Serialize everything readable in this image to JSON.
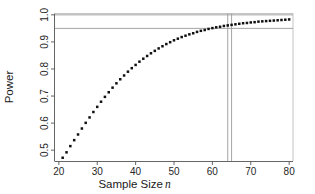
{
  "chart_data": {
    "type": "scatter",
    "title": "",
    "xlabel": "Sample Size",
    "xlabel_italic_suffix": "n",
    "ylabel": "Power",
    "xlim": [
      19,
      81
    ],
    "ylim": [
      0.46,
      1.005
    ],
    "xticks": [
      20,
      30,
      40,
      50,
      60,
      70,
      80
    ],
    "xticklabels": [
      "20",
      "30",
      "40",
      "50",
      "60",
      "70",
      "80"
    ],
    "yticks": [
      0.5,
      0.6,
      0.7,
      0.8,
      0.9,
      1.0
    ],
    "yticklabels": [
      "0.5",
      "0.6",
      "0.7",
      "0.8",
      "0.9",
      "1.0"
    ],
    "grid": false,
    "legend": "none",
    "marker": "filled-square",
    "marker_color": "#111111",
    "reference_lines": {
      "horizontal": [
        {
          "y": 1.0,
          "label": "1.0",
          "color": "#9a9a9a"
        },
        {
          "y": 0.95,
          "label": "0.95",
          "color": "#9a9a9a"
        }
      ],
      "vertical": [
        {
          "x": 64,
          "label": "64",
          "color": "#9a9a9a"
        },
        {
          "x": 65,
          "label": "65",
          "color": "#9a9a9a"
        }
      ]
    },
    "x": [
      21,
      22,
      23,
      24,
      25,
      26,
      27,
      28,
      29,
      30,
      31,
      32,
      33,
      34,
      35,
      36,
      37,
      38,
      39,
      40,
      41,
      42,
      43,
      44,
      45,
      46,
      47,
      48,
      49,
      50,
      51,
      52,
      53,
      54,
      55,
      56,
      57,
      58,
      59,
      60,
      61,
      62,
      63,
      64,
      65,
      66,
      67,
      68,
      69,
      70,
      71,
      72,
      73,
      74,
      75,
      76,
      77,
      78,
      79,
      80
    ],
    "values": [
      0.472,
      0.492,
      0.515,
      0.537,
      0.558,
      0.58,
      0.601,
      0.621,
      0.641,
      0.66,
      0.679,
      0.697,
      0.714,
      0.731,
      0.747,
      0.762,
      0.776,
      0.79,
      0.803,
      0.815,
      0.827,
      0.838,
      0.848,
      0.858,
      0.867,
      0.876,
      0.884,
      0.892,
      0.899,
      0.906,
      0.912,
      0.918,
      0.923,
      0.928,
      0.932,
      0.937,
      0.941,
      0.944,
      0.948,
      0.951,
      0.954,
      0.956,
      0.959,
      0.961,
      0.963,
      0.965,
      0.967,
      0.969,
      0.97,
      0.972,
      0.973,
      0.975,
      0.976,
      0.977,
      0.978,
      0.979,
      0.98,
      0.981,
      0.982,
      0.983
    ]
  }
}
